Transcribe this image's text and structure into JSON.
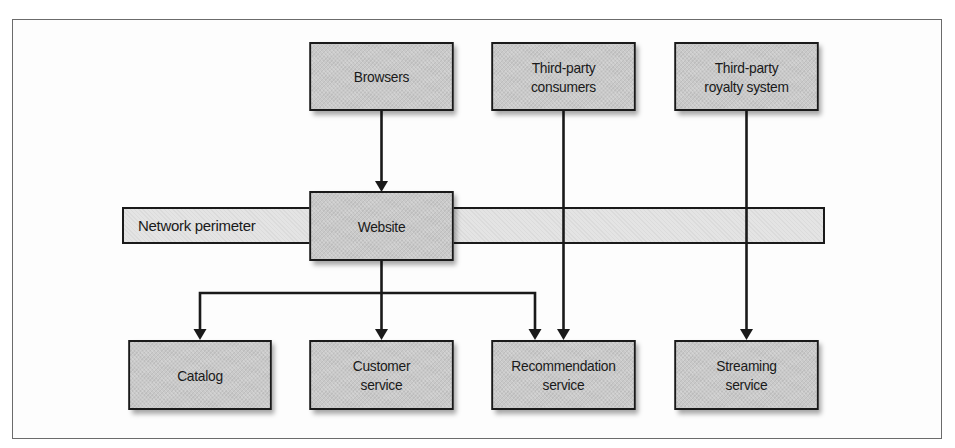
{
  "diagram": {
    "nodes": {
      "browsers": {
        "label": "Browsers"
      },
      "third_party_consumers": {
        "label": "Third-party\nconsumers"
      },
      "third_party_royalty": {
        "label": "Third-party\nroyalty system"
      },
      "website": {
        "label": "Website"
      },
      "network_perimeter": {
        "label": "Network perimeter"
      },
      "catalog": {
        "label": "Catalog"
      },
      "customer_service": {
        "label": "Customer\nservice"
      },
      "recommendation_service": {
        "label": "Recommendation\nservice"
      },
      "streaming_service": {
        "label": "Streaming\nservice"
      }
    },
    "edges": [
      {
        "from": "Browsers",
        "to": "Website"
      },
      {
        "from": "Website",
        "to": "Catalog"
      },
      {
        "from": "Website",
        "to": "Customer service"
      },
      {
        "from": "Website",
        "to": "Recommendation service"
      },
      {
        "from": "Third-party consumers",
        "to": "Recommendation service"
      },
      {
        "from": "Third-party royalty system",
        "to": "Streaming service"
      }
    ],
    "colors": {
      "box_fill": "#c9c9c9",
      "perimeter_fill": "#e4e4e4",
      "stroke": "#1a1a1a",
      "frame": "#6b6b6b"
    }
  }
}
